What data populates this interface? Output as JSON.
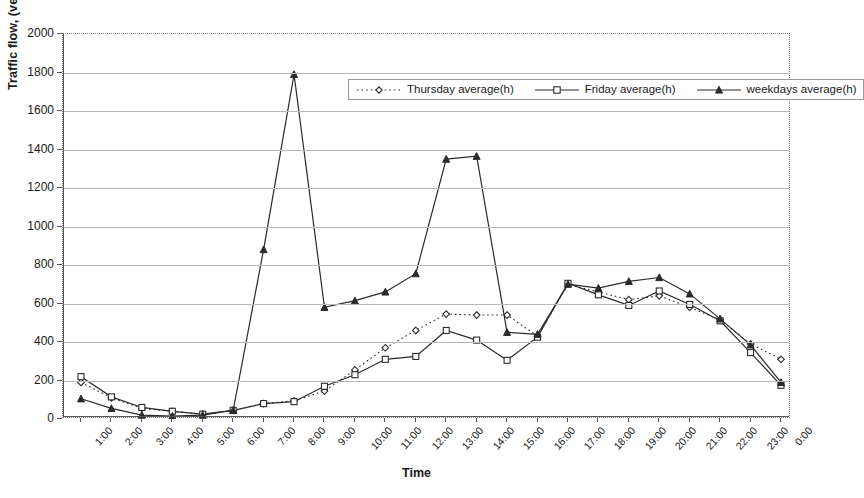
{
  "chart_data": {
    "type": "line",
    "title": "",
    "xlabel": "Time",
    "ylabel": "Traffic flow, (vehicle/hr)",
    "ylim": [
      0,
      2000
    ],
    "ytick_step": 200,
    "yticks": [
      0,
      200,
      400,
      600,
      800,
      1000,
      1200,
      1400,
      1600,
      1800,
      2000
    ],
    "grid": true,
    "legend_position": "top-center-inside",
    "categories": [
      "1:00",
      "2:00",
      "3:00",
      "4:00",
      "5:00",
      "6:00",
      "7:00",
      "8:00",
      "9:00",
      "10:00",
      "11:00",
      "12:00",
      "13:00",
      "14:00",
      "15:00",
      "16:00",
      "17:00",
      "18:00",
      "19:00",
      "20:00",
      "21:00",
      "22:00",
      "23:00",
      "0:00"
    ],
    "series": [
      {
        "name": "Thursday average(h)",
        "marker": "diamond",
        "line_style": "dotted",
        "values": [
          190,
          110,
          55,
          40,
          25,
          45,
          80,
          95,
          145,
          255,
          370,
          460,
          545,
          540,
          540,
          430,
          700,
          660,
          620,
          640,
          580,
          515,
          390,
          310
        ]
      },
      {
        "name": "Friday average(h)",
        "marker": "square",
        "line_style": "solid",
        "values": [
          220,
          115,
          60,
          40,
          25,
          45,
          80,
          90,
          170,
          230,
          310,
          325,
          460,
          410,
          305,
          425,
          705,
          645,
          590,
          665,
          595,
          510,
          345,
          175
        ]
      },
      {
        "name": "weekdays average(h)",
        "marker": "triangle",
        "line_style": "solid",
        "values": [
          105,
          55,
          20,
          15,
          20,
          45,
          880,
          1790,
          580,
          615,
          660,
          755,
          1350,
          1365,
          450,
          440,
          700,
          680,
          715,
          735,
          650,
          520,
          385,
          190
        ]
      }
    ]
  },
  "axes": {
    "y_title": "Traffic flow, (vehicle/hr)",
    "x_title": "Time"
  },
  "legend": {
    "items": [
      {
        "label": "Thursday average(h)"
      },
      {
        "label": "Friday average(h)"
      },
      {
        "label": "weekdays average(h)"
      }
    ]
  },
  "colors": {
    "line": "#2b2b2b",
    "grid": "#b9b9b9",
    "axis": "#555555",
    "frame": "#7d7d7d",
    "background": "#ffffff"
  }
}
